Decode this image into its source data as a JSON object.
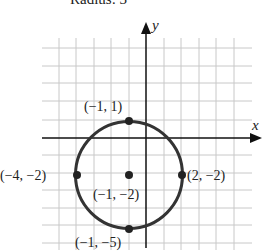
{
  "title": "Radius: 3",
  "axes": {
    "x_label": "x",
    "y_label": "y"
  },
  "grid": {
    "x_min": -5,
    "x_max": 5,
    "y_min": -6,
    "y_max": 5
  },
  "circle": {
    "center": [
      -1,
      -2
    ],
    "radius": 3,
    "equation_note": "circle centered at (-1, -2) with radius 3"
  },
  "points": [
    {
      "id": "top",
      "coords": [
        -1,
        1
      ],
      "label": "(−1, 1)"
    },
    {
      "id": "left",
      "coords": [
        -4,
        -2
      ],
      "label": "(−4, −2)"
    },
    {
      "id": "center",
      "coords": [
        -1,
        -2
      ],
      "label": "(−1, −2)"
    },
    {
      "id": "right",
      "coords": [
        2,
        -2
      ],
      "label": "(2, −2)"
    },
    {
      "id": "bottom",
      "coords": [
        -1,
        -5
      ],
      "label": "(−1, −5)"
    }
  ],
  "colors": {
    "grid": "#c8c8c8",
    "axis": "#111111",
    "circle": "#333333",
    "point": "#222222"
  }
}
